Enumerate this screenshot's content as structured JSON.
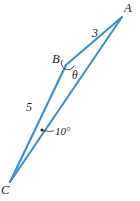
{
  "figure": {
    "type": "geometry-triangle-diagram",
    "background_color": "#ffffff",
    "stroke_color": "#3d8fc4",
    "text_color": "#1a1a1a",
    "vertices": [
      {
        "name": "A",
        "label": "A",
        "x": 122,
        "y": 17,
        "label_x": 124,
        "label_y": 2
      },
      {
        "name": "B",
        "label": "B",
        "x": 66,
        "y": 65,
        "label_x": 52,
        "label_y": 53
      },
      {
        "name": "C",
        "label": "C",
        "x": 10,
        "y": 182,
        "label_x": 1,
        "label_y": 184
      }
    ],
    "sides": [
      {
        "name": "BA",
        "label": "3",
        "label_x": 92,
        "label_y": 27
      },
      {
        "name": "CB",
        "label": "5",
        "label_x": 26,
        "label_y": 101
      },
      {
        "name": "CA",
        "label": "",
        "label_x": 0,
        "label_y": 0
      }
    ],
    "angles": [
      {
        "name": "theta-at-B",
        "label": "θ",
        "label_x": 72,
        "label_y": 70
      },
      {
        "name": "ten-degrees-at-C",
        "label": "10°",
        "label_x": 55,
        "label_y": 126
      }
    ]
  }
}
